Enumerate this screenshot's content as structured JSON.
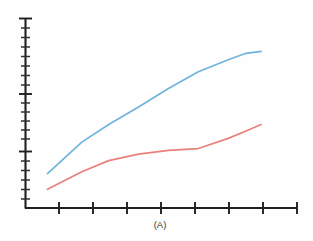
{
  "chart_data": {
    "type": "line",
    "title": "",
    "subtitle": "",
    "xlabel": "(A)",
    "ylabel": "",
    "grid": false,
    "legend": null,
    "legend_position": "none",
    "xlim": [
      0,
      8
    ],
    "ylim": [
      0,
      10
    ],
    "x_major_ticks": [
      1,
      2,
      3,
      4,
      5,
      6,
      7,
      8
    ],
    "x_tick_labels": [
      "",
      "",
      "",
      "",
      "",
      "",
      "",
      ""
    ],
    "y_major_ticks": [
      0,
      4,
      7,
      10
    ],
    "y_minor_ticks": [
      0.5,
      1,
      1.5,
      2,
      2.5,
      3,
      3.5,
      4.5,
      5,
      5.5,
      6,
      6.5,
      7.5,
      8,
      8.5,
      9,
      9.5
    ],
    "y_tick_labels": [
      "",
      "",
      "",
      ""
    ],
    "x": [
      0.35,
      1.5,
      2.4,
      3.4,
      4.4,
      5.4,
      6.4,
      7.0,
      7.5
    ],
    "series": [
      {
        "name": "upper-series",
        "color": "#6FB4DC",
        "values": [
          1.7,
          3.4,
          4.35,
          5.3,
          6.3,
          7.2,
          7.85,
          8.2,
          8.3
        ]
      },
      {
        "name": "lower-series",
        "color": "#E8817C",
        "values": [
          0.85,
          1.8,
          2.4,
          2.75,
          2.95,
          3.05,
          3.6,
          4.0,
          4.35
        ]
      }
    ],
    "annotations": [
      {
        "text": "(A)",
        "role": "panel-label",
        "position": "below-x-axis"
      }
    ],
    "colors": {
      "axis": "#202020",
      "upper_series": "#6FB4DC",
      "lower_series": "#E8817C",
      "background": "#FEFEFE",
      "caption": "#3A3A3A"
    }
  },
  "figure": {
    "panel_label": "(A)"
  }
}
